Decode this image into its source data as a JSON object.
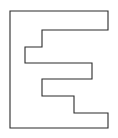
{
  "figure": {
    "name": "block-letter-e-outline",
    "alt_text": "Block letter E outline",
    "background_color": "#ffffff",
    "stroke_color": "#2b2b2b",
    "fill_color": "#ffffff",
    "stroke_width": 1.1,
    "canvas": {
      "width": 118,
      "height": 138
    },
    "polygon": {
      "closed": true,
      "points": "10,11 108,11 108,30 42,30 42,47 25,47 25,63 92,63 92,79 42,79 42,96 74,96 74,113 108,113 108,128 10,128",
      "vertices": [
        {
          "x": 10,
          "y": 11
        },
        {
          "x": 108,
          "y": 11
        },
        {
          "x": 108,
          "y": 30
        },
        {
          "x": 42,
          "y": 30
        },
        {
          "x": 42,
          "y": 47
        },
        {
          "x": 25,
          "y": 47
        },
        {
          "x": 25,
          "y": 63
        },
        {
          "x": 92,
          "y": 63
        },
        {
          "x": 92,
          "y": 79
        },
        {
          "x": 42,
          "y": 79
        },
        {
          "x": 42,
          "y": 96
        },
        {
          "x": 74,
          "y": 96
        },
        {
          "x": 74,
          "y": 113
        },
        {
          "x": 108,
          "y": 113
        },
        {
          "x": 108,
          "y": 128
        },
        {
          "x": 10,
          "y": 128
        }
      ]
    }
  }
}
